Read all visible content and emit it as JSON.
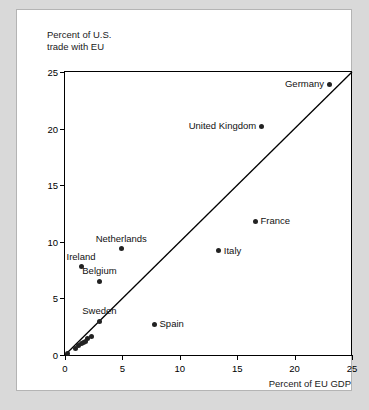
{
  "chart_data": {
    "type": "scatter",
    "title": "",
    "xlabel": "Percent of EU GDP",
    "ylabel": "Percent of U.S.\ntrade with EU",
    "xlim": [
      0,
      25
    ],
    "ylim": [
      0,
      25
    ],
    "xticks": [
      0,
      5,
      10,
      15,
      20,
      25
    ],
    "yticks": [
      0,
      5,
      10,
      15,
      20,
      25
    ],
    "xtick_labels": [
      "0",
      "5",
      "10",
      "15",
      "20",
      "25"
    ],
    "ytick_labels": [
      "0",
      "5",
      "10",
      "15",
      "20",
      "25"
    ],
    "grid": false,
    "legend": "none",
    "annotations": [
      {
        "name": "forty-five-degree-line",
        "kind": "reference-line",
        "from": [
          0,
          0
        ],
        "to": [
          25,
          25
        ]
      }
    ],
    "points": [
      {
        "label": "Germany",
        "x": 23.0,
        "y": 23.9,
        "label_pos": "left"
      },
      {
        "label": "United Kingdom",
        "x": 17.1,
        "y": 20.2,
        "label_pos": "left"
      },
      {
        "label": "France",
        "x": 16.6,
        "y": 11.8,
        "label_pos": "right"
      },
      {
        "label": "Italy",
        "x": 13.4,
        "y": 9.2,
        "label_pos": "right"
      },
      {
        "label": "Netherlands",
        "x": 4.9,
        "y": 9.4,
        "label_pos": "above"
      },
      {
        "label": "Ireland",
        "x": 1.4,
        "y": 7.8,
        "label_pos": "above"
      },
      {
        "label": "Belgium",
        "x": 3.0,
        "y": 6.5,
        "label_pos": "above"
      },
      {
        "label": "Sweden",
        "x": 3.0,
        "y": 3.0,
        "label_pos": "above"
      },
      {
        "label": "Spain",
        "x": 7.8,
        "y": 2.7,
        "label_pos": "right"
      },
      {
        "label": "",
        "x": 2.3,
        "y": 1.6,
        "label_pos": "none"
      },
      {
        "label": "",
        "x": 2.0,
        "y": 1.5,
        "label_pos": "none"
      },
      {
        "label": "",
        "x": 1.8,
        "y": 1.2,
        "label_pos": "none"
      },
      {
        "label": "",
        "x": 1.6,
        "y": 1.1,
        "label_pos": "none"
      },
      {
        "label": "",
        "x": 1.4,
        "y": 1.0,
        "label_pos": "none"
      },
      {
        "label": "",
        "x": 1.2,
        "y": 0.8,
        "label_pos": "none"
      },
      {
        "label": "",
        "x": 0.9,
        "y": 0.6,
        "label_pos": "none"
      },
      {
        "label": "",
        "x": 0.2,
        "y": 0.15,
        "label_pos": "none"
      }
    ],
    "colors": {
      "marker": "#222222",
      "axis": "#000000",
      "reference_line": "#000000",
      "panel_background": "#ffffff",
      "page_background": "#d9d9d9"
    }
  }
}
